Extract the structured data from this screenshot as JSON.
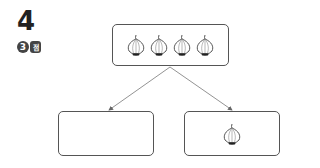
{
  "question": {
    "number": "4",
    "score_value": "3",
    "score_unit": "점"
  },
  "diagram": {
    "top_box": {
      "item": "onion-icon",
      "count": 4
    },
    "bottom_left_box": {
      "item": "",
      "count": 0
    },
    "bottom_right_box": {
      "item": "onion-icon",
      "count": 1
    },
    "line_color": "#777777",
    "border_color": "#555555"
  }
}
